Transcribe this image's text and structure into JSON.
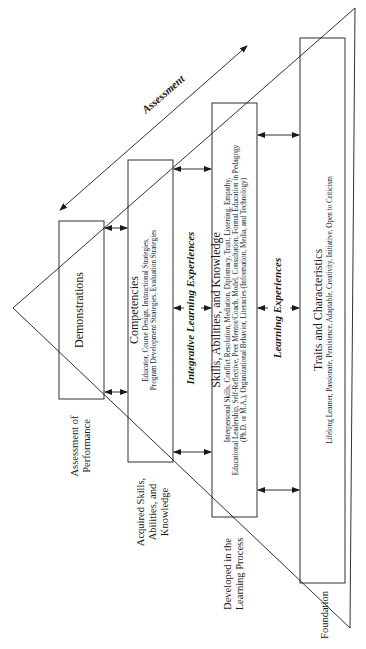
{
  "diagram": {
    "assessment_label": "Assessment",
    "levels": [
      {
        "id": "demonstrations",
        "title": "Demonstrations",
        "body": [],
        "side_label": [
          "Assessment of",
          "Performance"
        ]
      },
      {
        "id": "competencies",
        "title": "Competencies",
        "body": [
          "Educator, Course Design, Instructional Strategies,",
          "Program Development Strategies, Evaluation Strategies"
        ],
        "side_label": [
          "Acquired Skills,",
          "Abilities, and",
          "Knowledge"
        ]
      },
      {
        "id": "skills",
        "title": "Skills, Abilities, and Knowledge",
        "body": [
          "Interpersonal Skills, Conflict Resolution, Mediation, Diplomacy, Trust, Listening, Empathy,",
          "Educational Leadership, Self-Reflective, Peer Mentor/Coach, Model, Consultation, Formal Education in Pedagogy",
          "(Ph.D. or M.A.), Organizational Behavior, Literacies (Information, Media, and Technology)"
        ],
        "side_label": [
          "Developed in the",
          "Learning Process"
        ]
      },
      {
        "id": "traits",
        "title": "Traits and Characteristics",
        "body": [
          "Lifelong Learner, Passionate, Persistence, Adaptable, Creativity, Initiative, Open to Criticism"
        ],
        "side_label": [
          "Foundation"
        ]
      }
    ],
    "connectors": {
      "integrative": "Integrative Learning Experiences",
      "learning": "Learning Experiences"
    }
  }
}
